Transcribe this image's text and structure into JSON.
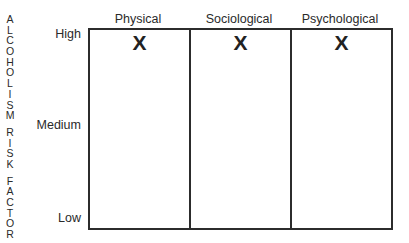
{
  "axis_title_letters": {
    "word1": [
      "A",
      "L",
      "C",
      "O",
      "H",
      "O",
      "L",
      "I",
      "S",
      "M"
    ],
    "word2": [
      "R",
      "I",
      "S",
      "K"
    ],
    "word3": [
      "F",
      "A",
      "C",
      "T",
      "O",
      "R"
    ]
  },
  "axis_title": "ALCOHOLISM RISK FACTOR",
  "y_levels": {
    "high": "High",
    "medium": "Medium",
    "low": "Low"
  },
  "columns": [
    {
      "label": "Physical",
      "mark": "X",
      "level": "High"
    },
    {
      "label": "Sociological",
      "mark": "X",
      "level": "High"
    },
    {
      "label": "Psychological",
      "mark": "X",
      "level": "High"
    }
  ]
}
